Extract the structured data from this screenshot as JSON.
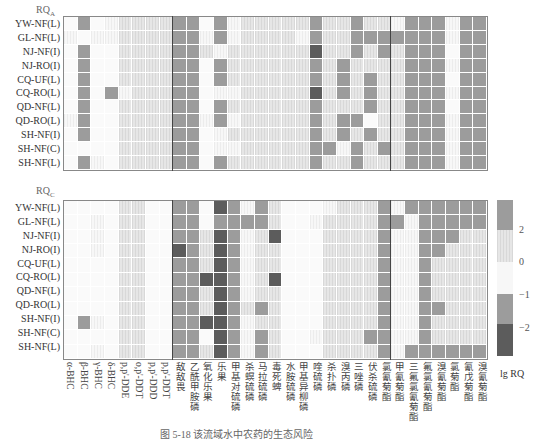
{
  "chart_data": [
    {
      "type": "heatmap",
      "title": "RQA",
      "rows": [
        "YW-NF(L)",
        "GL-NF(L)",
        "NJ-NF(I)",
        "NJ-RO(I)",
        "CQ-UF(L)",
        "CQ-RO(L)",
        "QD-NF(L)",
        "QD-RO(L)",
        "SH-NF(I)",
        "SH-NF(C)",
        "SH-NF(L)"
      ],
      "columns": [
        "α-BHC",
        "β-BHC",
        "γ-BHC",
        "δ-BHC",
        "p,p'-DDE",
        "o,p'-DDT",
        "p,p'-DDD",
        "p,p'-DDT",
        "敌敌畏",
        "乙酰甲胺磷",
        "氧化乐果",
        "乐果",
        "甲基对硫磷",
        "杀螟硫磷",
        "马拉硫磷",
        "毒死蜱",
        "水胺硫磷",
        "甲基异柳磷",
        "喹硫磷",
        "杀扑磷",
        "溴丙磷",
        "三唑磷",
        "伏杀硫磷",
        "氯氰菊酯",
        "甲氰菊酯",
        "三氟氯氰菊酯",
        "氟氯氰菊酯",
        "溴氰菊酯",
        "氯氰菊酯2",
        "氰戊菊酯",
        "溴氰菊酯2"
      ],
      "levels_note": "0=white(-1..0 low),1=very light,2=light(0..2),3=mid gray(>2 / -1..-2),4=dark(<-2)",
      "values": [
        [
          0,
          3,
          0,
          1,
          2,
          2,
          2,
          2,
          3,
          3,
          0,
          3,
          1,
          2,
          2,
          2,
          2,
          2,
          3,
          2,
          2,
          3,
          2,
          2,
          1,
          3,
          3,
          3,
          1,
          3,
          3
        ],
        [
          1,
          0,
          1,
          1,
          2,
          2,
          2,
          2,
          3,
          3,
          1,
          3,
          1,
          2,
          2,
          2,
          2,
          1,
          3,
          2,
          2,
          3,
          3,
          3,
          3,
          3,
          3,
          3,
          1,
          3,
          3
        ],
        [
          0,
          3,
          0,
          0,
          2,
          2,
          2,
          2,
          3,
          3,
          2,
          1,
          2,
          2,
          2,
          2,
          2,
          2,
          4,
          2,
          2,
          3,
          2,
          3,
          2,
          3,
          3,
          3,
          0,
          3,
          3
        ],
        [
          0,
          3,
          0,
          0,
          2,
          2,
          2,
          2,
          3,
          3,
          0,
          3,
          2,
          2,
          2,
          2,
          2,
          2,
          3,
          2,
          3,
          2,
          2,
          2,
          2,
          3,
          3,
          3,
          1,
          3,
          3
        ],
        [
          0,
          3,
          0,
          0,
          2,
          2,
          2,
          2,
          3,
          3,
          0,
          3,
          2,
          2,
          2,
          2,
          2,
          2,
          3,
          2,
          3,
          2,
          3,
          2,
          2,
          3,
          3,
          3,
          0,
          3,
          3
        ],
        [
          0,
          3,
          0,
          3,
          1,
          2,
          2,
          2,
          3,
          3,
          0,
          1,
          1,
          2,
          2,
          2,
          2,
          2,
          4,
          2,
          3,
          2,
          3,
          2,
          2,
          3,
          3,
          3,
          1,
          3,
          3
        ],
        [
          0,
          3,
          0,
          0,
          2,
          2,
          2,
          2,
          3,
          3,
          0,
          3,
          2,
          2,
          2,
          2,
          2,
          2,
          3,
          2,
          2,
          2,
          3,
          2,
          2,
          3,
          3,
          3,
          0,
          3,
          3
        ],
        [
          1,
          3,
          0,
          0,
          2,
          2,
          2,
          2,
          3,
          3,
          1,
          3,
          1,
          2,
          2,
          2,
          2,
          2,
          3,
          2,
          3,
          3,
          0,
          2,
          2,
          3,
          3,
          3,
          1,
          3,
          3
        ],
        [
          0,
          3,
          0,
          0,
          2,
          2,
          2,
          2,
          3,
          3,
          0,
          1,
          2,
          2,
          2,
          2,
          2,
          2,
          3,
          2,
          3,
          2,
          3,
          2,
          2,
          3,
          3,
          3,
          1,
          3,
          3
        ],
        [
          0,
          0,
          0,
          0,
          2,
          2,
          2,
          2,
          3,
          3,
          0,
          1,
          1,
          2,
          2,
          2,
          2,
          2,
          3,
          3,
          1,
          3,
          2,
          3,
          2,
          3,
          3,
          3,
          1,
          3,
          3
        ],
        [
          0,
          3,
          1,
          0,
          2,
          2,
          2,
          2,
          3,
          3,
          0,
          3,
          2,
          2,
          2,
          2,
          2,
          2,
          3,
          2,
          2,
          3,
          2,
          2,
          2,
          3,
          3,
          3,
          1,
          3,
          3
        ]
      ]
    },
    {
      "type": "heatmap",
      "title": "RQC",
      "rows": [
        "YW-NF(L)",
        "GL-NF(L)",
        "NJ-NF(I)",
        "NJ-RO(I)",
        "CQ-UF(L)",
        "CQ-RO(L)",
        "QD-NF(L)",
        "QD-RO(L)",
        "SH-NF(I)",
        "SH-NF(C)",
        "SH-NF(L)"
      ],
      "values": [
        [
          0,
          0,
          0,
          0,
          2,
          2,
          0,
          0,
          3,
          3,
          0,
          4,
          3,
          1,
          3,
          2,
          0,
          0,
          0,
          1,
          2,
          2,
          2,
          3,
          1,
          3,
          3,
          3,
          3,
          3,
          3
        ],
        [
          0,
          0,
          1,
          0,
          2,
          2,
          0,
          0,
          3,
          3,
          0,
          3,
          3,
          3,
          3,
          2,
          0,
          0,
          1,
          2,
          2,
          2,
          2,
          3,
          3,
          1,
          3,
          3,
          3,
          3,
          3
        ],
        [
          0,
          0,
          1,
          0,
          2,
          2,
          0,
          0,
          3,
          3,
          2,
          4,
          3,
          1,
          2,
          4,
          0,
          0,
          0,
          2,
          2,
          2,
          2,
          3,
          1,
          1,
          3,
          3,
          3,
          2,
          2
        ],
        [
          0,
          0,
          1,
          0,
          2,
          2,
          0,
          0,
          4,
          3,
          2,
          4,
          3,
          1,
          2,
          2,
          0,
          0,
          0,
          2,
          2,
          2,
          2,
          3,
          1,
          1,
          3,
          3,
          2,
          2,
          2
        ],
        [
          0,
          0,
          0,
          0,
          2,
          2,
          0,
          0,
          3,
          3,
          2,
          4,
          3,
          1,
          2,
          2,
          0,
          0,
          0,
          2,
          2,
          2,
          2,
          3,
          1,
          1,
          3,
          2,
          2,
          2,
          2
        ],
        [
          0,
          0,
          0,
          0,
          2,
          2,
          0,
          0,
          3,
          3,
          4,
          4,
          3,
          1,
          2,
          4,
          0,
          0,
          0,
          2,
          2,
          2,
          2,
          3,
          1,
          1,
          3,
          2,
          2,
          2,
          2
        ],
        [
          0,
          0,
          0,
          0,
          2,
          2,
          0,
          0,
          3,
          3,
          2,
          4,
          3,
          1,
          2,
          2,
          0,
          0,
          0,
          2,
          2,
          2,
          2,
          3,
          1,
          1,
          3,
          2,
          2,
          2,
          2
        ],
        [
          0,
          0,
          0,
          0,
          2,
          2,
          0,
          0,
          3,
          3,
          2,
          4,
          3,
          2,
          3,
          2,
          0,
          0,
          0,
          2,
          2,
          2,
          2,
          3,
          1,
          1,
          3,
          3,
          2,
          2,
          2
        ],
        [
          0,
          3,
          1,
          0,
          2,
          2,
          0,
          0,
          3,
          3,
          4,
          4,
          3,
          1,
          2,
          2,
          0,
          0,
          0,
          2,
          2,
          2,
          2,
          3,
          1,
          1,
          3,
          2,
          2,
          2,
          2
        ],
        [
          0,
          0,
          0,
          0,
          2,
          2,
          0,
          0,
          3,
          3,
          0,
          4,
          3,
          1,
          3,
          2,
          0,
          0,
          1,
          2,
          2,
          2,
          3,
          3,
          1,
          1,
          3,
          2,
          2,
          2,
          2
        ],
        [
          0,
          0,
          1,
          0,
          2,
          2,
          0,
          0,
          3,
          3,
          2,
          4,
          3,
          1,
          3,
          2,
          0,
          0,
          0,
          2,
          2,
          2,
          2,
          3,
          1,
          3,
          3,
          3,
          3,
          3,
          3
        ]
      ]
    }
  ],
  "labels": {
    "top_title": "RQ",
    "top_sub": "A",
    "bottom_title": "RQ",
    "bottom_sub": "C",
    "rows": [
      "YW-NF(L)",
      "GL-NF(L)",
      "NJ-NF(I)",
      "NJ-RO(I)",
      "CQ-UF(L)",
      "CQ-RO(L)",
      "QD-NF(L)",
      "QD-RO(L)",
      "SH-NF(I)",
      "SH-NF(C)",
      "SH-NF(L)"
    ],
    "columns": [
      "α-BHC",
      "β-BHC",
      "γ-BHC",
      "δ-BHC",
      "p,p'-DDE",
      "o,p'-DDT",
      "p,p'-DDD",
      "p,p'-DDT",
      "敌敌畏",
      "乙酰甲胺磷",
      "氧化乐果",
      "乐果",
      "甲基对硫磷",
      "杀螟硫磷",
      "马拉硫磷",
      "毒死蜱",
      "水胺硫磷",
      "甲基异柳磷",
      "喹硫磷",
      "杀扑磷",
      "溴丙磷",
      "三唑磷",
      "伏杀硫磷",
      "氯氰菊酯",
      "甲氰菊酯",
      "三氟氯氰菊酯",
      "氟氯氰菊酯",
      "溴氰菊酯",
      "氯菊酯",
      "氰戊菊酯",
      "溴氰菊酯"
    ]
  },
  "legend": {
    "title": "lg RQ",
    "ticks": [
      "2",
      "0",
      "−1",
      "−2"
    ],
    "colors": [
      "#9c9c9c",
      "#e6e6e6",
      "#f7f7f7",
      "#9c9c9c",
      "#5c5c5c"
    ]
  },
  "caption": "图 5-18  该流域水中农药的生态风险"
}
